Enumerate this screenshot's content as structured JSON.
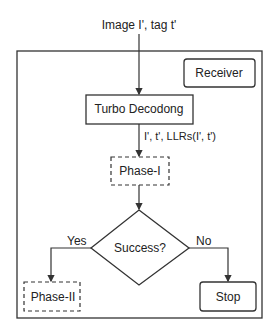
{
  "input_label": "Image I', tag t'",
  "receiver_label": "Receiver",
  "turbo_label": "Turbo Decodong",
  "edge_label": "I', t', LLRs(I', t')",
  "phase1_label": "Phase-I",
  "decision_label": "Success?",
  "yes_label": "Yes",
  "no_label": "No",
  "phase2_label": "Phase-II",
  "stop_label": "Stop"
}
